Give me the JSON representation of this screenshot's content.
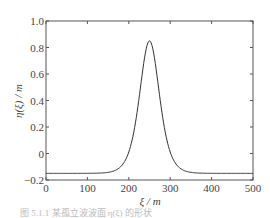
{
  "chart_data": {
    "type": "line",
    "title": "",
    "xlabel": "ξ / m",
    "ylabel": "η(ξ) / m",
    "xlim": [
      0,
      500
    ],
    "ylim": [
      -0.2,
      1.0
    ],
    "xticks": [
      0,
      100,
      200,
      300,
      400,
      500
    ],
    "yticks": [
      -0.2,
      0,
      0.2,
      0.4,
      0.6,
      0.8,
      1.0
    ],
    "ytick_labels": [
      "−0.2",
      "0",
      "0.2",
      "0.4",
      "0.6",
      "0.8",
      "1.0"
    ],
    "grid": false,
    "legend": null,
    "series": [
      {
        "name": "η(ξ)",
        "description": "solitary-wave profile, baseline ≈ -0.15, peak ≈ 0.85 at ξ ≈ 250",
        "baseline": -0.15,
        "peak": 0.85,
        "peak_x": 250,
        "x": [
          0,
          50,
          100,
          150,
          175,
          200,
          215,
          225,
          235,
          245,
          250,
          255,
          265,
          275,
          285,
          300,
          325,
          350,
          400,
          450,
          500
        ],
        "y": [
          -0.15,
          -0.15,
          -0.15,
          -0.14,
          -0.12,
          -0.05,
          0.08,
          0.25,
          0.5,
          0.78,
          0.85,
          0.78,
          0.5,
          0.25,
          0.08,
          -0.05,
          -0.12,
          -0.14,
          -0.15,
          -0.15,
          -0.15
        ]
      }
    ]
  },
  "caption": "图 5.1.1 某孤立波波面 η(ξ) 的形状"
}
